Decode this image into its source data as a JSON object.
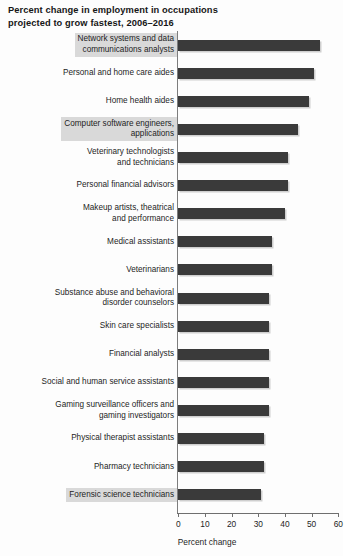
{
  "chart_data": {
    "type": "bar",
    "orientation": "horizontal",
    "title": "Percent change in employment in occupations\nprojected to grow fastest, 2006–2016",
    "xlabel": "Percent change",
    "ylabel": "",
    "xlim": [
      0,
      60
    ],
    "xticks": [
      0,
      10,
      20,
      30,
      40,
      50,
      60
    ],
    "xtick_labels": [
      "0",
      "10",
      "20",
      "30",
      "40",
      "50",
      "60"
    ],
    "grid": false,
    "legend": null,
    "bar_color": "#3a3a3a",
    "highlight_color": "#d9d9d9",
    "categories": [
      "Network systems and data\ncommunications analysts",
      "Personal and home care aides",
      "Home health aides",
      "Computer software engineers,\napplications",
      "Veterinary technologists\nand technicians",
      "Personal financial advisors",
      "Makeup artists, theatrical\nand performance",
      "Medical assistants",
      "Veterinarians",
      "Substance abuse and behavioral\ndisorder counselors",
      "Skin care specialists",
      "Financial analysts",
      "Social and human service assistants",
      "Gaming surveillance officers and\ngaming investigators",
      "Physical therapist assistants",
      "Pharmacy technicians",
      "Forensic science technicians"
    ],
    "values": [
      53,
      51,
      49,
      45,
      41,
      41,
      40,
      35,
      35,
      34,
      34,
      34,
      34,
      34,
      32,
      32,
      31
    ],
    "highlighted_categories": [
      "Network systems and data\ncommunications analysts",
      "Computer software engineers,\napplications",
      "Forensic science technicians"
    ]
  }
}
